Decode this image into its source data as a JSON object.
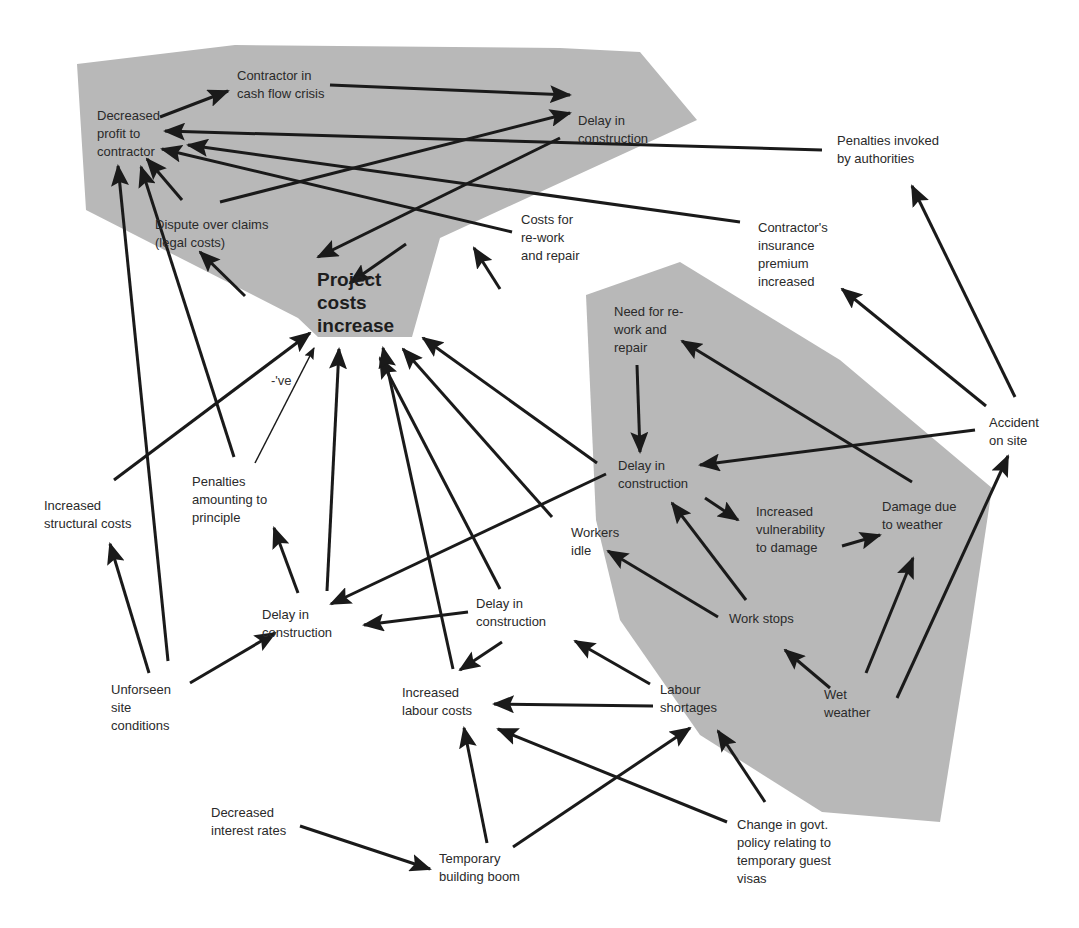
{
  "diagram": {
    "type": "causal-loop",
    "colors": {
      "region_fill": "#b8b8b8",
      "arrow": "#1a1a1a",
      "text": "#2a2a2a",
      "background": "#ffffff"
    },
    "regions": [
      {
        "id": "contractor-region",
        "points": "77,64 235,45 560,48 640,52 697,120 440,238 412,337 318,337 298,318 86,210"
      },
      {
        "id": "weather-region",
        "points": "586,295 680,262 840,360 992,488 970,635 940,822 822,812 700,735 620,620 596,520"
      }
    ],
    "nodes": [
      {
        "id": "decreased-profit",
        "label": "Decreased\nprofit to\ncontractor",
        "x": 97,
        "y": 107
      },
      {
        "id": "cash-flow-crisis",
        "label": "Contractor in\ncash flow crisis",
        "x": 237,
        "y": 67
      },
      {
        "id": "delay-top",
        "label": "Delay in\nconstruction",
        "x": 578,
        "y": 112
      },
      {
        "id": "penalties-authorities",
        "label": "Penalties invoked\nby authorities",
        "x": 837,
        "y": 132
      },
      {
        "id": "dispute-claims",
        "label": "Dispute over claims\n(legal costs)",
        "x": 155,
        "y": 216
      },
      {
        "id": "costs-rework",
        "label": "Costs for\nre-work\nand repair",
        "x": 521,
        "y": 211
      },
      {
        "id": "insurance-premium",
        "label": "Contractor's\ninsurance\npremium\nincreased",
        "x": 758,
        "y": 219
      },
      {
        "id": "project-costs",
        "label": "Project\ncosts\nincrease",
        "x": 317,
        "y": 268,
        "main": true
      },
      {
        "id": "need-rework",
        "label": "Need for re-\nwork and\nrepair",
        "x": 614,
        "y": 303
      },
      {
        "id": "ve-note",
        "label": "-'ve",
        "x": 271,
        "y": 372,
        "note": true
      },
      {
        "id": "accident-site",
        "label": "Accident\non site",
        "x": 989,
        "y": 414
      },
      {
        "id": "delay-right",
        "label": "Delay in\nconstruction",
        "x": 618,
        "y": 457
      },
      {
        "id": "increased-structural",
        "label": "Increased\nstructural costs",
        "x": 44,
        "y": 497
      },
      {
        "id": "penalties-principle",
        "label": "Penalties\namounting to\nprinciple",
        "x": 192,
        "y": 473
      },
      {
        "id": "increased-vulnerability",
        "label": "Increased\nvulnerability\nto damage",
        "x": 756,
        "y": 503
      },
      {
        "id": "damage-weather",
        "label": "Damage due\nto weather",
        "x": 882,
        "y": 498
      },
      {
        "id": "workers-idle",
        "label": "Workers\nidle",
        "x": 571,
        "y": 524
      },
      {
        "id": "delay-mid",
        "label": "Delay in\nconstruction",
        "x": 476,
        "y": 595
      },
      {
        "id": "work-stops",
        "label": "Work stops",
        "x": 729,
        "y": 610
      },
      {
        "id": "delay-left",
        "label": "Delay in\nconstruction",
        "x": 262,
        "y": 606
      },
      {
        "id": "unforseen-site",
        "label": "Unforseen\nsite\nconditions",
        "x": 111,
        "y": 681
      },
      {
        "id": "increased-labour",
        "label": "Increased\nlabour costs",
        "x": 402,
        "y": 684
      },
      {
        "id": "labour-shortages",
        "label": "Labour\nshortages",
        "x": 660,
        "y": 681
      },
      {
        "id": "wet-weather",
        "label": "Wet\nweather",
        "x": 824,
        "y": 686
      },
      {
        "id": "decreased-interest",
        "label": "Decreased\ninterest rates",
        "x": 211,
        "y": 804
      },
      {
        "id": "building-boom",
        "label": "Temporary\nbuilding boom",
        "x": 439,
        "y": 850
      },
      {
        "id": "govt-policy",
        "label": "Change in govt.\npolicy relating to\ntemporary guest\nvisas",
        "x": 737,
        "y": 816
      }
    ],
    "edges": [
      {
        "from": "decreased-profit",
        "to": "cash-flow-crisis",
        "x1": 160,
        "y1": 117,
        "x2": 228,
        "y2": 91
      },
      {
        "from": "cash-flow-crisis",
        "to": "delay-top",
        "x1": 330,
        "y1": 85,
        "x2": 570,
        "y2": 95
      },
      {
        "from": "dispute-claims",
        "to": "delay-top",
        "x1": 220,
        "y1": 202,
        "x2": 570,
        "y2": 113
      },
      {
        "from": "delay-top",
        "to": "project-costs",
        "x1": 560,
        "y1": 138,
        "x2": 318,
        "y2": 257
      },
      {
        "from": "penalties-authorities",
        "to": "decreased-profit",
        "x1": 822,
        "y1": 150,
        "x2": 165,
        "y2": 131
      },
      {
        "from": "insurance-premium",
        "to": "decreased-profit",
        "x1": 740,
        "y1": 222,
        "x2": 188,
        "y2": 145
      },
      {
        "from": "costs-rework",
        "to": "decreased-profit",
        "x1": 512,
        "y1": 232,
        "x2": 162,
        "y2": 149
      },
      {
        "from": "dispute-claims",
        "to": "decreased-profit",
        "x1": 182,
        "y1": 200,
        "x2": 147,
        "y2": 159
      },
      {
        "from": "project-costs",
        "to": "dispute-claims",
        "x1": 245,
        "y1": 296,
        "x2": 200,
        "y2": 252
      },
      {
        "from": "costs-rework",
        "to": "project-costs",
        "x1": 406,
        "y1": 244,
        "x2": 350,
        "y2": 283
      },
      {
        "from": "need-rework",
        "to": "costs-rework",
        "x1": 500,
        "y1": 289,
        "x2": 474,
        "y2": 248
      },
      {
        "from": "need-rework",
        "to": "delay-right",
        "x1": 637,
        "y1": 365,
        "x2": 640,
        "y2": 452
      },
      {
        "from": "damage-weather",
        "to": "need-rework",
        "x1": 912,
        "y1": 482,
        "x2": 682,
        "y2": 341
      },
      {
        "from": "accident-site",
        "to": "delay-right",
        "x1": 975,
        "y1": 430,
        "x2": 700,
        "y2": 465
      },
      {
        "from": "accident-site",
        "to": "insurance-premium",
        "x1": 986,
        "y1": 406,
        "x2": 842,
        "y2": 289
      },
      {
        "from": "accident-site",
        "to": "penalties-authorities",
        "x1": 1015,
        "y1": 397,
        "x2": 912,
        "y2": 186
      },
      {
        "from": "delay-right",
        "to": "increased-vulnerability",
        "x1": 705,
        "y1": 498,
        "x2": 738,
        "y2": 520
      },
      {
        "from": "increased-vulnerability",
        "to": "damage-weather",
        "x1": 842,
        "y1": 546,
        "x2": 880,
        "y2": 535
      },
      {
        "from": "wet-weather",
        "to": "damage-weather",
        "x1": 866,
        "y1": 673,
        "x2": 913,
        "y2": 558
      },
      {
        "from": "wet-weather",
        "to": "accident-site",
        "x1": 897,
        "y1": 698,
        "x2": 1008,
        "y2": 456
      },
      {
        "from": "wet-weather",
        "to": "work-stops",
        "x1": 830,
        "y1": 688,
        "x2": 785,
        "y2": 650
      },
      {
        "from": "work-stops",
        "to": "delay-right",
        "x1": 746,
        "y1": 600,
        "x2": 672,
        "y2": 503
      },
      {
        "from": "work-stops",
        "to": "workers-idle",
        "x1": 718,
        "y1": 617,
        "x2": 608,
        "y2": 551
      },
      {
        "from": "delay-right",
        "to": "delay-left",
        "x1": 606,
        "y1": 474,
        "x2": 331,
        "y2": 604
      },
      {
        "from": "delay-right",
        "to": "project-costs",
        "x1": 597,
        "y1": 463,
        "x2": 423,
        "y2": 338
      },
      {
        "from": "workers-idle",
        "to": "project-costs",
        "x1": 552,
        "y1": 517,
        "x2": 403,
        "y2": 349
      },
      {
        "from": "delay-mid",
        "to": "project-costs",
        "x1": 500,
        "y1": 589,
        "x2": 380,
        "y2": 358
      },
      {
        "from": "increased-labour",
        "to": "project-costs",
        "x1": 453,
        "y1": 669,
        "x2": 383,
        "y2": 348
      },
      {
        "from": "delay-left",
        "to": "project-costs",
        "x1": 327,
        "y1": 591,
        "x2": 339,
        "y2": 349
      },
      {
        "from": "delay-left",
        "to": "penalties-principle",
        "x1": 298,
        "y1": 593,
        "x2": 274,
        "y2": 528
      },
      {
        "from": "penalties-principle",
        "to": "project-costs",
        "x1": 255,
        "y1": 463,
        "x2": 314,
        "y2": 348,
        "thin": true
      },
      {
        "from": "penalties-principle",
        "to": "decreased-profit",
        "x1": 234,
        "y1": 457,
        "x2": 141,
        "y2": 167
      },
      {
        "from": "increased-structural",
        "to": "project-costs",
        "x1": 114,
        "y1": 480,
        "x2": 310,
        "y2": 333
      },
      {
        "from": "unforseen-site",
        "to": "increased-structural",
        "x1": 149,
        "y1": 673,
        "x2": 110,
        "y2": 544
      },
      {
        "from": "unforseen-site",
        "to": "decreased-profit",
        "x1": 168,
        "y1": 661,
        "x2": 118,
        "y2": 166
      },
      {
        "from": "unforseen-site",
        "to": "delay-left",
        "x1": 190,
        "y1": 683,
        "x2": 275,
        "y2": 633
      },
      {
        "from": "delay-mid",
        "to": "delay-left",
        "x1": 468,
        "y1": 612,
        "x2": 364,
        "y2": 625
      },
      {
        "from": "delay-mid",
        "to": "increased-labour",
        "x1": 502,
        "y1": 642,
        "x2": 460,
        "y2": 670
      },
      {
        "from": "labour-shortages",
        "to": "delay-mid",
        "x1": 650,
        "y1": 684,
        "x2": 575,
        "y2": 641
      },
      {
        "from": "labour-shortages",
        "to": "increased-labour",
        "x1": 653,
        "y1": 706,
        "x2": 494,
        "y2": 704
      },
      {
        "from": "building-boom",
        "to": "increased-labour",
        "x1": 487,
        "y1": 843,
        "x2": 464,
        "y2": 728
      },
      {
        "from": "building-boom",
        "to": "labour-shortages",
        "x1": 513,
        "y1": 847,
        "x2": 690,
        "y2": 728
      },
      {
        "from": "govt-policy",
        "to": "labour-shortages",
        "x1": 765,
        "y1": 802,
        "x2": 718,
        "y2": 731
      },
      {
        "from": "govt-policy",
        "to": "increased-labour",
        "x1": 727,
        "y1": 822,
        "x2": 498,
        "y2": 729
      },
      {
        "from": "decreased-interest",
        "to": "building-boom",
        "x1": 300,
        "y1": 826,
        "x2": 430,
        "y2": 869
      }
    ]
  }
}
